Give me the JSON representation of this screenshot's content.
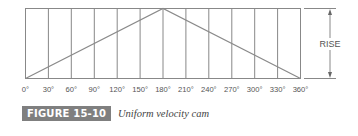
{
  "figure": {
    "label": "FIGURE 15-10",
    "caption": "Uniform velocity cam"
  },
  "diagram": {
    "type": "cam displacement diagram",
    "x_ticks": [
      "0°",
      "30°",
      "60°",
      "90°",
      "120°",
      "150°",
      "180°",
      "210°",
      "240°",
      "270°",
      "300°",
      "330°",
      "360°"
    ],
    "dimension_label": "RISE",
    "peak_at": "180°",
    "line_color": "#888888",
    "text_color": "#555555",
    "label_bg_color": "#7f7f7f"
  }
}
